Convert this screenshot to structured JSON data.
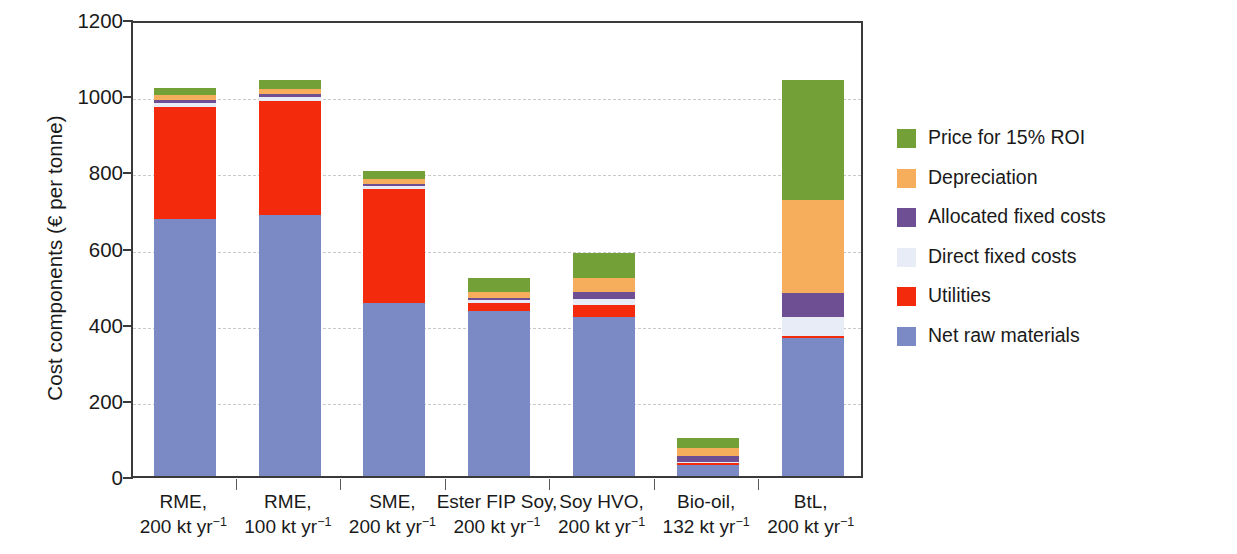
{
  "chart_data": {
    "type": "bar",
    "subtype": "stacked-bar",
    "title": "",
    "xlabel": "",
    "ylabel": "Cost components (€ per tonne)",
    "ylim": [
      0,
      1200
    ],
    "yticks": [
      0,
      200,
      400,
      600,
      800,
      1000,
      1200
    ],
    "ytick_labels": [
      "0",
      "200",
      "400",
      "600",
      "800",
      "1000",
      "1200"
    ],
    "grid": true,
    "legend_position": "right",
    "categories": [
      "RME, 200 kt yr-1",
      "RME, 100 kt yr-1",
      "SME, 200 kt yr-1",
      "Ester FIP Soy, 200 kt yr-1",
      "Soy HVO, 200 kt yr-1",
      "Bio-oil, 132 kt yr-1",
      "BtL, 200 kt yr-1"
    ],
    "category_labels": [
      {
        "line1": "RME,",
        "line2_value": "200",
        "line2_unit": "kt yr",
        "line2_exp": "−1"
      },
      {
        "line1": "RME,",
        "line2_value": "100",
        "line2_unit": "kt yr",
        "line2_exp": "−1"
      },
      {
        "line1": "SME,",
        "line2_value": "200",
        "line2_unit": "kt yr",
        "line2_exp": "−1"
      },
      {
        "line1": "Ester FIP Soy,",
        "line2_value": "200",
        "line2_unit": "kt yr",
        "line2_exp": "−1"
      },
      {
        "line1": "Soy HVO,",
        "line2_value": "200",
        "line2_unit": "kt yr",
        "line2_exp": "−1"
      },
      {
        "line1": "Bio-oil,",
        "line2_value": "132",
        "line2_unit": "kt yr",
        "line2_exp": "−1"
      },
      {
        "line1": "BtL,",
        "line2_value": "200",
        "line2_unit": "kt yr",
        "line2_exp": "−1"
      }
    ],
    "series": [
      {
        "name": "Net raw materials",
        "color": "#7b8ac4",
        "values": [
          675,
          685,
          454,
          433,
          418,
          30,
          362
        ]
      },
      {
        "name": "Utilities",
        "color": "#f42a0c",
        "values": [
          295,
          300,
          300,
          22,
          30,
          4,
          6
        ]
      },
      {
        "name": "Direct fixed costs",
        "color": "#e8ecf6",
        "values": [
          10,
          10,
          8,
          8,
          18,
          4,
          50
        ]
      },
      {
        "name": "Allocated fixed costs",
        "color": "#6e4f94",
        "values": [
          8,
          8,
          5,
          5,
          16,
          14,
          62
        ]
      },
      {
        "name": "Depreciation",
        "color": "#f7ae5c",
        "values": [
          12,
          14,
          13,
          16,
          37,
          21,
          245
        ]
      },
      {
        "name": "Price for 15% ROI",
        "color": "#74a038",
        "values": [
          20,
          23,
          20,
          36,
          66,
          27,
          315
        ]
      }
    ],
    "totals": [
      1020,
      1040,
      800,
      520,
      585,
      100,
      1040
    ]
  },
  "legend": {
    "items": [
      {
        "label": "Price for 15% ROI",
        "color": "#74a038"
      },
      {
        "label": "Depreciation",
        "color": "#f7ae5c"
      },
      {
        "label": "Allocated fixed costs",
        "color": "#6e4f94"
      },
      {
        "label": "Direct fixed costs",
        "color": "#e8ecf6"
      },
      {
        "label": "Utilities",
        "color": "#f42a0c"
      },
      {
        "label": "Net raw materials",
        "color": "#7b8ac4"
      }
    ]
  },
  "axis": {
    "y_title": "Cost components (€ per tonne)"
  }
}
